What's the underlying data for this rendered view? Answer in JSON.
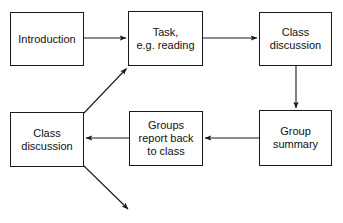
{
  "diagram": {
    "type": "flowchart",
    "title": "",
    "background_color": "#ffffff",
    "line_color": "#1a1a1a",
    "text_color": "#111111",
    "nodes": [
      {
        "id": "introduction",
        "label": "Introduction",
        "x": 10,
        "y": 12,
        "width": 74,
        "height": 54
      },
      {
        "id": "task",
        "label": "Task,\ne.g. reading",
        "x": 128,
        "y": 11,
        "width": 75,
        "height": 55
      },
      {
        "id": "class-discussion-top",
        "label": "Class\ndiscussion",
        "x": 259,
        "y": 12,
        "width": 73,
        "height": 54
      },
      {
        "id": "class-discussion-bottom",
        "label": "Class\ndiscussion",
        "x": 10,
        "y": 112,
        "width": 74,
        "height": 55
      },
      {
        "id": "groups-report-back",
        "label": "Groups\nreport back\nto class",
        "x": 129,
        "y": 111,
        "width": 74,
        "height": 55
      },
      {
        "id": "group-summary",
        "label": "Group\nsummary",
        "x": 259,
        "y": 110,
        "width": 73,
        "height": 56
      }
    ],
    "edges": [
      {
        "id": "intro-to-task",
        "from": "introduction",
        "to": "task",
        "direction": "right",
        "x1": 84,
        "y1": 38,
        "x2": 128,
        "y2": 38
      },
      {
        "id": "task-to-class-discussion-top",
        "from": "task",
        "to": "class-discussion-top",
        "direction": "right",
        "x1": 203,
        "y1": 38,
        "x2": 259,
        "y2": 38
      },
      {
        "id": "class-discussion-top-to-group-summary",
        "from": "class-discussion-top",
        "to": "group-summary",
        "direction": "down",
        "x1": 296,
        "y1": 66,
        "x2": 296,
        "y2": 110
      },
      {
        "id": "group-summary-to-groups-report-back",
        "from": "group-summary",
        "to": "groups-report-back",
        "direction": "left",
        "x1": 259,
        "y1": 138,
        "x2": 203,
        "y2": 138
      },
      {
        "id": "groups-report-back-to-class-discussion-bottom",
        "from": "groups-report-back",
        "to": "class-discussion-bottom",
        "direction": "left",
        "x1": 129,
        "y1": 138,
        "x2": 84,
        "y2": 138
      },
      {
        "id": "class-discussion-bottom-to-task",
        "from": "class-discussion-bottom",
        "to": "task",
        "direction": "up-right-diagonal",
        "x1": 84,
        "y1": 113,
        "x2": 128,
        "y2": 67
      },
      {
        "id": "class-discussion-bottom-to-next",
        "from": "class-discussion-bottom",
        "to": "",
        "direction": "down-right-diagonal",
        "x1": 84,
        "y1": 166,
        "x2": 130,
        "y2": 211
      }
    ]
  }
}
